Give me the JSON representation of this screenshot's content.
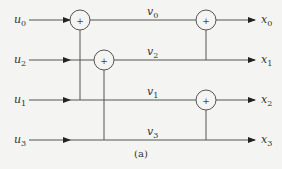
{
  "diagram": {
    "caption": "(a)",
    "inputs": [
      {
        "name": "u",
        "sub": "0",
        "y": 20
      },
      {
        "name": "u",
        "sub": "2",
        "y": 60
      },
      {
        "name": "u",
        "sub": "1",
        "y": 100
      },
      {
        "name": "u",
        "sub": "3",
        "y": 140
      }
    ],
    "intermediates": [
      {
        "name": "v",
        "sub": "0",
        "x": 150,
        "y": 14
      },
      {
        "name": "v",
        "sub": "2",
        "x": 150,
        "y": 54
      },
      {
        "name": "v",
        "sub": "1",
        "x": 150,
        "y": 94
      },
      {
        "name": "v",
        "sub": "3",
        "x": 150,
        "y": 134
      }
    ],
    "outputs": [
      {
        "name": "x",
        "sub": "0",
        "y": 20
      },
      {
        "name": "x",
        "sub": "1",
        "y": 60
      },
      {
        "name": "x",
        "sub": "2",
        "y": 100
      },
      {
        "name": "x",
        "sub": "3",
        "y": 140
      }
    ],
    "adders": [
      {
        "id": "adder-u0-u1",
        "cx": 80,
        "cy": 20,
        "symbol": "+"
      },
      {
        "id": "adder-u2-u3",
        "cx": 104,
        "cy": 60,
        "symbol": "+"
      },
      {
        "id": "adder-v0-v2",
        "cx": 206,
        "cy": 20,
        "symbol": "+"
      },
      {
        "id": "adder-v1-v3",
        "cx": 206,
        "cy": 100,
        "symbol": "+"
      }
    ]
  }
}
